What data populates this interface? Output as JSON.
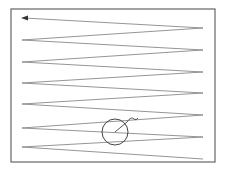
{
  "diagram": {
    "type": "raster-scan-path",
    "colors": {
      "frame": "#666666",
      "path": "#7a7a7a",
      "target": "#444444",
      "background": "#ffffff"
    },
    "frame": {
      "x": 11,
      "y": 9,
      "width": 204,
      "height": 153
    },
    "path_points": [
      [
        203,
        159
      ],
      [
        22,
        147
      ],
      [
        203,
        137
      ],
      [
        22,
        128
      ],
      [
        203,
        115
      ],
      [
        22,
        104
      ],
      [
        203,
        93
      ],
      [
        22,
        83
      ],
      [
        203,
        72
      ],
      [
        22,
        62
      ],
      [
        203,
        50
      ],
      [
        22,
        40
      ],
      [
        203,
        28
      ],
      [
        24,
        18
      ]
    ],
    "arrowhead": {
      "x": 22,
      "y": 18,
      "direction": "left"
    },
    "target_circle": {
      "cx": 115,
      "cy": 132,
      "r": 13
    },
    "pointer": {
      "from": [
        115,
        132
      ],
      "to": [
        127,
        122
      ],
      "hook_end": [
        137,
        118
      ]
    }
  }
}
